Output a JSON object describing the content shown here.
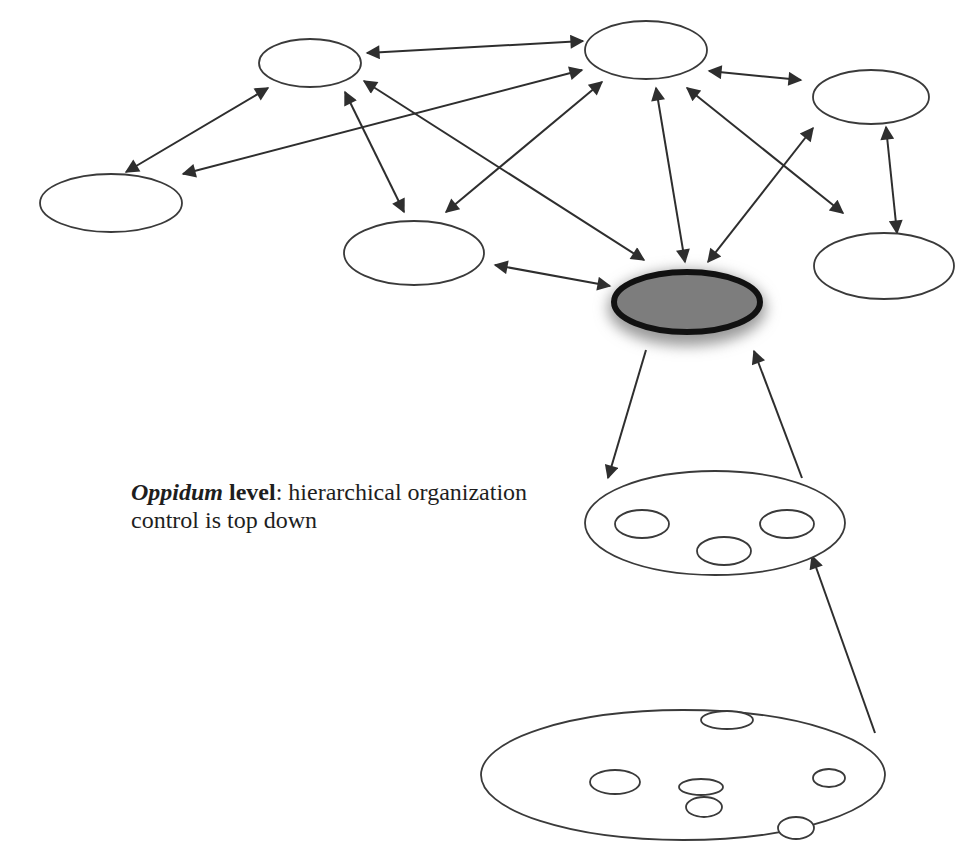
{
  "caption": {
    "term": "Oppidum",
    "keyword": " level",
    "line1_rest": ": hierarchical organization",
    "line2": "control is top down"
  },
  "colors": {
    "stroke": "#3a3a3a",
    "core_fill": "#7d7d7d",
    "core_stroke": "#111111",
    "background": "#ffffff"
  },
  "nodes": [
    {
      "id": "n1",
      "cx": 310,
      "cy": 63,
      "rx": 51,
      "ry": 24
    },
    {
      "id": "n2",
      "cx": 646,
      "cy": 50,
      "rx": 61,
      "ry": 29
    },
    {
      "id": "n3",
      "cx": 871,
      "cy": 97,
      "rx": 58,
      "ry": 27
    },
    {
      "id": "n4",
      "cx": 111,
      "cy": 203,
      "rx": 71,
      "ry": 29
    },
    {
      "id": "n5",
      "cx": 414,
      "cy": 253,
      "rx": 70,
      "ry": 32
    },
    {
      "id": "n6",
      "cx": 884,
      "cy": 266,
      "rx": 70,
      "ry": 33
    },
    {
      "id": "core",
      "cx": 687,
      "cy": 302,
      "rx": 73,
      "ry": 30
    }
  ],
  "edges": [
    {
      "x1": 367,
      "y1": 53,
      "x2": 583,
      "y2": 41,
      "double": true
    },
    {
      "x1": 268,
      "y1": 88,
      "x2": 126,
      "y2": 172,
      "double": true
    },
    {
      "x1": 183,
      "y1": 174,
      "x2": 582,
      "y2": 70,
      "double": true
    },
    {
      "x1": 345,
      "y1": 92,
      "x2": 404,
      "y2": 212,
      "double": true
    },
    {
      "x1": 364,
      "y1": 81,
      "x2": 644,
      "y2": 260,
      "double": true
    },
    {
      "x1": 446,
      "y1": 212,
      "x2": 602,
      "y2": 82,
      "double": true
    },
    {
      "x1": 656,
      "y1": 88,
      "x2": 685,
      "y2": 262,
      "double": true
    },
    {
      "x1": 687,
      "y1": 88,
      "x2": 843,
      "y2": 213,
      "double": true
    },
    {
      "x1": 709,
      "y1": 71,
      "x2": 801,
      "y2": 80,
      "double": true
    },
    {
      "x1": 708,
      "y1": 262,
      "x2": 813,
      "y2": 128,
      "double": true
    },
    {
      "x1": 886,
      "y1": 127,
      "x2": 897,
      "y2": 233,
      "double": true
    },
    {
      "x1": 495,
      "y1": 265,
      "x2": 610,
      "y2": 286,
      "double": true
    },
    {
      "x1": 646,
      "y1": 350,
      "x2": 608,
      "y2": 478,
      "double": false
    },
    {
      "x1": 802,
      "y1": 478,
      "x2": 754,
      "y2": 351,
      "double": false
    },
    {
      "x1": 875,
      "y1": 733,
      "x2": 812,
      "y2": 556,
      "double": false
    }
  ],
  "group_mid": {
    "outer": {
      "cx": 715,
      "cy": 523,
      "rx": 130,
      "ry": 52
    },
    "inner": [
      {
        "cx": 642,
        "cy": 524,
        "rx": 27,
        "ry": 14
      },
      {
        "cx": 787,
        "cy": 524,
        "rx": 27,
        "ry": 14
      },
      {
        "cx": 724,
        "cy": 551,
        "rx": 27,
        "ry": 14
      }
    ]
  },
  "group_low": {
    "outer": {
      "cx": 683,
      "cy": 775,
      "rx": 202,
      "ry": 65
    },
    "inner": [
      {
        "cx": 727,
        "cy": 720,
        "rx": 26,
        "ry": 9
      },
      {
        "cx": 615,
        "cy": 782,
        "rx": 25,
        "ry": 12
      },
      {
        "cx": 701,
        "cy": 787,
        "rx": 22,
        "ry": 8
      },
      {
        "cx": 704,
        "cy": 807,
        "rx": 18,
        "ry": 10
      },
      {
        "cx": 829,
        "cy": 778,
        "rx": 16,
        "ry": 9
      },
      {
        "cx": 796,
        "cy": 828,
        "rx": 18,
        "ry": 11
      }
    ]
  }
}
